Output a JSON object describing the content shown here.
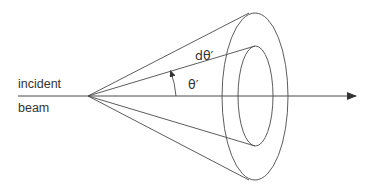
{
  "diagram": {
    "labels": {
      "incident": "incident",
      "beam": "beam",
      "dtheta": "dθ′",
      "theta": "θ′"
    },
    "colors": {
      "stroke": "#4a4a4a",
      "text": "#333333",
      "background": "#ffffff"
    }
  }
}
